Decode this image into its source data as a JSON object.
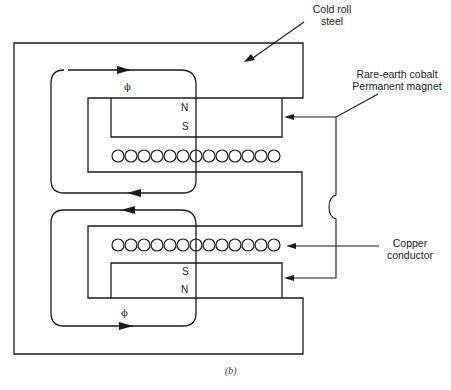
{
  "figure": {
    "caption": "(b)",
    "stroke_color": "#1a1a1a",
    "background": "#ffffff"
  },
  "labels": {
    "cold_roll_steel": [
      "Cold roll",
      "steel"
    ],
    "permanent_magnet": [
      "Rare-earth cobalt",
      "Permanent magnet"
    ],
    "copper_conductor": [
      "Copper",
      "conductor"
    ]
  },
  "top_magnet": {
    "north_label": "N",
    "south_label": "S",
    "flux_label": "ϕ"
  },
  "bottom_magnet": {
    "south_label": "S",
    "north_label": "N",
    "flux_label": "ϕ"
  },
  "coils": {
    "top_row_count": 13,
    "bottom_row_count": 13
  }
}
